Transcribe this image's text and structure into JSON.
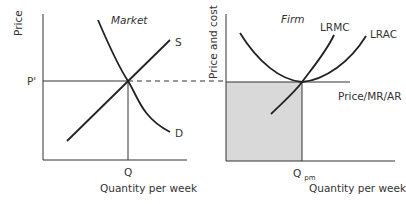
{
  "market_panel": {
    "title": "Market",
    "y_axis_label": "Price",
    "x_axis_label": "Quantity per week",
    "price_label": "P'",
    "quantity_label": "Q",
    "supply_label": "S",
    "demand_label": "D"
  },
  "firm_panel": {
    "title": "Firm",
    "y_axis_label": "Price and cost",
    "x_axis_label": "Quantity per week",
    "quantity_label": "Q",
    "quantity_subscript": "pm",
    "lrmc_label": "LRMC",
    "lrac_label": "LRAC",
    "price_line_label": "Price/MR/AR"
  },
  "colors": {
    "line": "#222222",
    "axis": "#333333",
    "shade": "#d9d9d9",
    "text": "#333333"
  }
}
